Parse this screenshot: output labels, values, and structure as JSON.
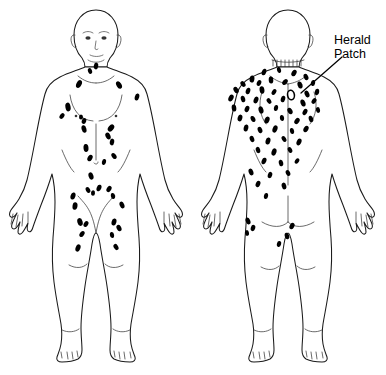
{
  "figure": {
    "background_color": "#ffffff",
    "lesion_color": "#000000",
    "outline_color": "#1a1a1a",
    "width": 386,
    "height": 375
  },
  "annotations": [
    {
      "id": "herald-patch",
      "line1": "Herald",
      "line2": "Patch",
      "text_x": 334,
      "text_y": 44,
      "leader": {
        "x1": 342,
        "y1": 57,
        "x2": 301,
        "y2": 93
      }
    }
  ],
  "views": [
    {
      "id": "anterior",
      "name": "anterior-view",
      "label": "Anterior",
      "center_x": 96,
      "lesions": [
        {
          "cx": 96,
          "cy": 66,
          "rx": 2.2,
          "ry": 3.4,
          "rot": 10
        },
        {
          "cx": 90,
          "cy": 71,
          "rx": 2.0,
          "ry": 3.0,
          "rot": -20
        },
        {
          "cx": 79,
          "cy": 84,
          "rx": 2.6,
          "ry": 4.2,
          "rot": 25
        },
        {
          "cx": 119,
          "cy": 85,
          "rx": 2.5,
          "ry": 4.0,
          "rot": -30
        },
        {
          "cx": 137,
          "cy": 97,
          "rx": 2.2,
          "ry": 3.6,
          "rot": 15
        },
        {
          "cx": 68,
          "cy": 107,
          "rx": 2.6,
          "ry": 4.4,
          "rot": -10
        },
        {
          "cx": 62,
          "cy": 116,
          "rx": 2.1,
          "ry": 3.2,
          "rot": 35
        },
        {
          "cx": 81,
          "cy": 117,
          "rx": 2.0,
          "ry": 2.6,
          "rot": 0
        },
        {
          "cx": 84,
          "cy": 121,
          "rx": 2.2,
          "ry": 3.0,
          "rot": 20
        },
        {
          "cx": 84,
          "cy": 129,
          "rx": 2.4,
          "ry": 3.8,
          "rot": -15
        },
        {
          "cx": 111,
          "cy": 128,
          "rx": 2.6,
          "ry": 4.0,
          "rot": 40
        },
        {
          "cx": 108,
          "cy": 136,
          "rx": 2.4,
          "ry": 3.6,
          "rot": -25
        },
        {
          "cx": 112,
          "cy": 142,
          "rx": 2.2,
          "ry": 3.4,
          "rot": 10
        },
        {
          "cx": 86,
          "cy": 148,
          "rx": 2.5,
          "ry": 3.9,
          "rot": -5
        },
        {
          "cx": 90,
          "cy": 158,
          "rx": 2.3,
          "ry": 3.5,
          "rot": 30
        },
        {
          "cx": 114,
          "cy": 156,
          "rx": 2.2,
          "ry": 3.3,
          "rot": -35
        },
        {
          "cx": 104,
          "cy": 162,
          "rx": 2.0,
          "ry": 3.0,
          "rot": 15
        },
        {
          "cx": 91,
          "cy": 176,
          "rx": 2.4,
          "ry": 3.7,
          "rot": -18
        },
        {
          "cx": 99,
          "cy": 188,
          "rx": 2.3,
          "ry": 3.4,
          "rot": 22
        },
        {
          "cx": 88,
          "cy": 190,
          "rx": 2.1,
          "ry": 3.1,
          "rot": -28
        },
        {
          "cx": 93,
          "cy": 193,
          "rx": 2.0,
          "ry": 2.8,
          "rot": 5
        },
        {
          "cx": 109,
          "cy": 189,
          "rx": 2.2,
          "ry": 3.3,
          "rot": 33
        },
        {
          "cx": 113,
          "cy": 196,
          "rx": 2.1,
          "ry": 3.0,
          "rot": -12
        },
        {
          "cx": 73,
          "cy": 196,
          "rx": 2.4,
          "ry": 3.6,
          "rot": 18
        },
        {
          "cx": 122,
          "cy": 205,
          "rx": 2.3,
          "ry": 3.5,
          "rot": -22
        },
        {
          "cx": 75,
          "cy": 206,
          "rx": 2.5,
          "ry": 3.8,
          "rot": 8
        },
        {
          "cx": 80,
          "cy": 222,
          "rx": 2.6,
          "ry": 4.0,
          "rot": -16
        },
        {
          "cx": 86,
          "cy": 224,
          "rx": 2.2,
          "ry": 3.2,
          "rot": 28
        },
        {
          "cx": 114,
          "cy": 222,
          "rx": 2.4,
          "ry": 3.6,
          "rot": 14
        },
        {
          "cx": 119,
          "cy": 228,
          "rx": 2.3,
          "ry": 3.4,
          "rot": -26
        },
        {
          "cx": 82,
          "cy": 234,
          "rx": 2.2,
          "ry": 3.3,
          "rot": 35
        },
        {
          "cx": 112,
          "cy": 235,
          "rx": 2.1,
          "ry": 3.1,
          "rot": -8
        },
        {
          "cx": 78,
          "cy": 248,
          "rx": 2.4,
          "ry": 3.7,
          "rot": 20
        },
        {
          "cx": 116,
          "cy": 247,
          "rx": 2.2,
          "ry": 3.3,
          "rot": -30
        }
      ]
    },
    {
      "id": "posterior",
      "name": "posterior-view",
      "label": "Posterior",
      "center_x": 288,
      "herald_patch": {
        "cx": 291,
        "cy": 95,
        "rx": 3.4,
        "ry": 4.8,
        "rot": -10
      },
      "lesions": [
        {
          "cx": 264,
          "cy": 72,
          "rx": 2.2,
          "ry": 3.4,
          "rot": 20
        },
        {
          "cx": 279,
          "cy": 70,
          "rx": 2.0,
          "ry": 3.0,
          "rot": -15
        },
        {
          "cx": 294,
          "cy": 73,
          "rx": 2.3,
          "ry": 3.5,
          "rot": 30
        },
        {
          "cx": 306,
          "cy": 77,
          "rx": 2.2,
          "ry": 3.3,
          "rot": -25
        },
        {
          "cx": 252,
          "cy": 79,
          "rx": 2.4,
          "ry": 3.6,
          "rot": 10
        },
        {
          "cx": 243,
          "cy": 84,
          "rx": 2.2,
          "ry": 3.2,
          "rot": -35
        },
        {
          "cx": 259,
          "cy": 83,
          "rx": 2.1,
          "ry": 3.1,
          "rot": 25
        },
        {
          "cx": 271,
          "cy": 80,
          "rx": 2.3,
          "ry": 3.5,
          "rot": -5
        },
        {
          "cx": 285,
          "cy": 82,
          "rx": 2.2,
          "ry": 3.4,
          "rot": 40
        },
        {
          "cx": 300,
          "cy": 85,
          "rx": 2.4,
          "ry": 3.6,
          "rot": -18
        },
        {
          "cx": 313,
          "cy": 83,
          "rx": 2.1,
          "ry": 3.0,
          "rot": 12
        },
        {
          "cx": 236,
          "cy": 90,
          "rx": 2.3,
          "ry": 3.4,
          "rot": -28
        },
        {
          "cx": 248,
          "cy": 91,
          "rx": 2.2,
          "ry": 3.3,
          "rot": 18
        },
        {
          "cx": 262,
          "cy": 90,
          "rx": 2.4,
          "ry": 3.7,
          "rot": -10
        },
        {
          "cx": 274,
          "cy": 92,
          "rx": 2.1,
          "ry": 3.1,
          "rot": 32
        },
        {
          "cx": 307,
          "cy": 94,
          "rx": 2.3,
          "ry": 3.5,
          "rot": -22
        },
        {
          "cx": 317,
          "cy": 92,
          "rx": 2.2,
          "ry": 3.2,
          "rot": 8
        },
        {
          "cx": 231,
          "cy": 98,
          "rx": 2.4,
          "ry": 3.6,
          "rot": 26
        },
        {
          "cx": 243,
          "cy": 99,
          "rx": 2.2,
          "ry": 3.3,
          "rot": -14
        },
        {
          "cx": 256,
          "cy": 100,
          "rx": 2.3,
          "ry": 3.5,
          "rot": 20
        },
        {
          "cx": 269,
          "cy": 101,
          "rx": 2.1,
          "ry": 3.0,
          "rot": -32
        },
        {
          "cx": 283,
          "cy": 99,
          "rx": 2.2,
          "ry": 3.3,
          "rot": 15
        },
        {
          "cx": 303,
          "cy": 103,
          "rx": 2.4,
          "ry": 3.6,
          "rot": -20
        },
        {
          "cx": 314,
          "cy": 101,
          "rx": 2.1,
          "ry": 3.1,
          "rot": 35
        },
        {
          "cx": 234,
          "cy": 108,
          "rx": 2.3,
          "ry": 3.5,
          "rot": -8
        },
        {
          "cx": 247,
          "cy": 109,
          "rx": 2.2,
          "ry": 3.2,
          "rot": 24
        },
        {
          "cx": 261,
          "cy": 110,
          "rx": 2.4,
          "ry": 3.7,
          "rot": -16
        },
        {
          "cx": 276,
          "cy": 108,
          "rx": 2.1,
          "ry": 3.0,
          "rot": 10
        },
        {
          "cx": 290,
          "cy": 111,
          "rx": 2.3,
          "ry": 3.4,
          "rot": -30
        },
        {
          "cx": 305,
          "cy": 112,
          "rx": 2.2,
          "ry": 3.3,
          "rot": 28
        },
        {
          "cx": 318,
          "cy": 110,
          "rx": 2.0,
          "ry": 2.9,
          "rot": -12
        },
        {
          "cx": 240,
          "cy": 118,
          "rx": 2.3,
          "ry": 3.5,
          "rot": 16
        },
        {
          "cx": 253,
          "cy": 119,
          "rx": 2.2,
          "ry": 3.2,
          "rot": -26
        },
        {
          "cx": 267,
          "cy": 120,
          "rx": 2.4,
          "ry": 3.6,
          "rot": 22
        },
        {
          "cx": 282,
          "cy": 118,
          "rx": 2.1,
          "ry": 3.1,
          "rot": -6
        },
        {
          "cx": 297,
          "cy": 121,
          "rx": 2.3,
          "ry": 3.4,
          "rot": 34
        },
        {
          "cx": 311,
          "cy": 119,
          "rx": 2.2,
          "ry": 3.3,
          "rot": -18
        },
        {
          "cx": 246,
          "cy": 128,
          "rx": 2.3,
          "ry": 3.5,
          "rot": 12
        },
        {
          "cx": 260,
          "cy": 130,
          "rx": 2.2,
          "ry": 3.2,
          "rot": -24
        },
        {
          "cx": 275,
          "cy": 129,
          "rx": 2.4,
          "ry": 3.7,
          "rot": 20
        },
        {
          "cx": 292,
          "cy": 131,
          "rx": 2.1,
          "ry": 3.0,
          "rot": -10
        },
        {
          "cx": 306,
          "cy": 129,
          "rx": 2.3,
          "ry": 3.4,
          "rot": 30
        },
        {
          "cx": 252,
          "cy": 139,
          "rx": 2.2,
          "ry": 3.3,
          "rot": -20
        },
        {
          "cx": 268,
          "cy": 141,
          "rx": 2.4,
          "ry": 3.6,
          "rot": 14
        },
        {
          "cx": 284,
          "cy": 139,
          "rx": 2.1,
          "ry": 3.1,
          "rot": -32
        },
        {
          "cx": 299,
          "cy": 142,
          "rx": 2.3,
          "ry": 3.5,
          "rot": 25
        },
        {
          "cx": 258,
          "cy": 150,
          "rx": 2.2,
          "ry": 3.2,
          "rot": -15
        },
        {
          "cx": 274,
          "cy": 152,
          "rx": 2.4,
          "ry": 3.7,
          "rot": 18
        },
        {
          "cx": 290,
          "cy": 150,
          "rx": 2.1,
          "ry": 3.0,
          "rot": -28
        },
        {
          "cx": 264,
          "cy": 161,
          "rx": 2.3,
          "ry": 3.4,
          "rot": 22
        },
        {
          "cx": 281,
          "cy": 163,
          "rx": 2.2,
          "ry": 3.3,
          "rot": -12
        },
        {
          "cx": 297,
          "cy": 161,
          "rx": 2.0,
          "ry": 2.9,
          "rot": 32
        },
        {
          "cx": 251,
          "cy": 172,
          "rx": 2.3,
          "ry": 3.5,
          "rot": -20
        },
        {
          "cx": 270,
          "cy": 175,
          "rx": 2.2,
          "ry": 3.2,
          "rot": 16
        },
        {
          "cx": 288,
          "cy": 173,
          "rx": 2.1,
          "ry": 3.1,
          "rot": -26
        },
        {
          "cx": 258,
          "cy": 184,
          "rx": 2.2,
          "ry": 3.3,
          "rot": 24
        },
        {
          "cx": 284,
          "cy": 186,
          "rx": 2.3,
          "ry": 3.4,
          "rot": -14
        },
        {
          "cx": 266,
          "cy": 196,
          "rx": 2.1,
          "ry": 3.0,
          "rot": 10
        },
        {
          "cx": 248,
          "cy": 221,
          "rx": 2.3,
          "ry": 3.5,
          "rot": -22
        },
        {
          "cx": 253,
          "cy": 228,
          "rx": 2.2,
          "ry": 3.2,
          "rot": 18
        },
        {
          "cx": 247,
          "cy": 233,
          "rx": 2.0,
          "ry": 2.9,
          "rot": -8
        },
        {
          "cx": 292,
          "cy": 226,
          "rx": 2.3,
          "ry": 3.4,
          "rot": 26
        },
        {
          "cx": 287,
          "cy": 236,
          "rx": 2.2,
          "ry": 3.3,
          "rot": -18
        },
        {
          "cx": 279,
          "cy": 244,
          "rx": 2.1,
          "ry": 3.0,
          "rot": 14
        }
      ]
    }
  ]
}
